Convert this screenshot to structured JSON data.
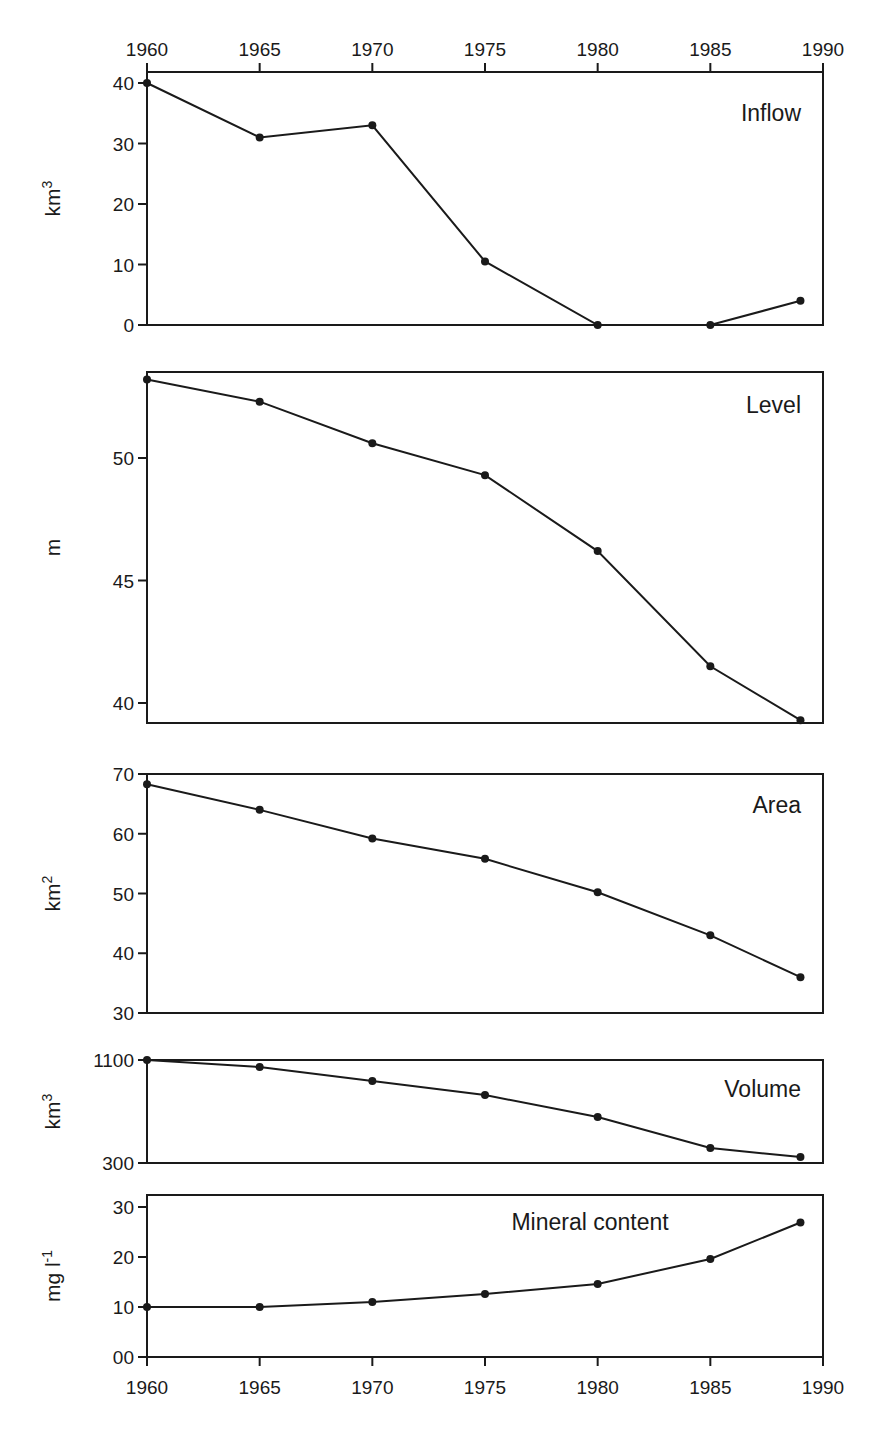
{
  "chart_data": {
    "type": "line",
    "x": [
      1960,
      1965,
      1970,
      1975,
      1980,
      1985,
      1989
    ],
    "xlim": [
      1960,
      1990
    ],
    "x_ticks": [
      "1960",
      "1965",
      "1970",
      "1975",
      "1980",
      "1985",
      "1990"
    ],
    "grid": false,
    "legend": "none",
    "panels": [
      {
        "title": "Inflow",
        "ylabel": "km",
        "ylabel_sup": "3",
        "ylim": [
          0,
          40
        ],
        "y_ticks": [
          "0",
          "10",
          "20",
          "30",
          "40"
        ],
        "y_tick_values": [
          0,
          10,
          20,
          30,
          40
        ],
        "values": [
          40,
          31,
          33,
          10.5,
          0,
          0,
          4
        ],
        "title_position": "top-right"
      },
      {
        "title": "Level",
        "ylabel": "m",
        "ylabel_sup": "",
        "ylim": [
          39.2,
          53.9
        ],
        "y_ticks": [
          "40",
          "45",
          "50"
        ],
        "y_tick_values": [
          40,
          45,
          50
        ],
        "values": [
          53.2,
          52.3,
          50.6,
          49.3,
          46.2,
          41.5,
          39.3
        ],
        "title_position": "top-right"
      },
      {
        "title": "Area",
        "ylabel": "km",
        "ylabel_sup": "2",
        "ylim": [
          30,
          70
        ],
        "y_ticks": [
          "30",
          "40",
          "50",
          "60",
          "70"
        ],
        "y_tick_values": [
          30,
          40,
          50,
          60,
          70
        ],
        "values": [
          68.3,
          64,
          59.2,
          55.8,
          50.2,
          43,
          36
        ],
        "title_position": "top-right"
      },
      {
        "title": "Volume",
        "ylabel": "km",
        "ylabel_sup": "3",
        "ylim": [
          300,
          1100
        ],
        "y_ticks": [
          "300",
          "1100"
        ],
        "y_tick_values": [
          300,
          1100
        ],
        "values": [
          1100,
          1045,
          937,
          828,
          657,
          416,
          346
        ],
        "title_position": "top-right"
      },
      {
        "title": "Mineral content",
        "ylabel": "mg l",
        "ylabel_sup": "-1",
        "ylim": [
          0,
          32.5
        ],
        "y_ticks": [
          "00",
          "10",
          "20",
          "30"
        ],
        "y_tick_values": [
          0,
          10,
          20,
          30
        ],
        "values": [
          10,
          10,
          11,
          12.6,
          14.6,
          19.6,
          26.9
        ],
        "title_position": "top-center"
      }
    ]
  }
}
